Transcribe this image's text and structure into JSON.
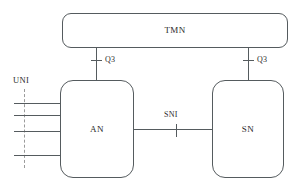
{
  "diagram": {
    "nodes": {
      "tmn": {
        "label": "TMN"
      },
      "an": {
        "label": "AN"
      },
      "sn": {
        "label": "SN"
      }
    },
    "interfaces": {
      "q3_left": {
        "label": "Q3"
      },
      "q3_right": {
        "label": "Q3"
      },
      "sni": {
        "label": "SNI"
      },
      "uni": {
        "label": "UNI"
      }
    },
    "colors": {
      "stroke": "#555b5e",
      "text": "#2b2b2b",
      "boundary": "#9b9b9b",
      "background": "#ffffff"
    }
  }
}
